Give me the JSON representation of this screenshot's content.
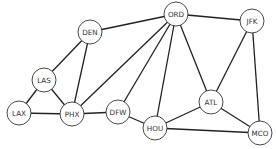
{
  "graph": {
    "node_radius": 12,
    "colors": {
      "edge": "#222222",
      "node_stroke": "#333333",
      "node_fill": "#ffffff",
      "label": "#333333"
    },
    "nodes": [
      {
        "id": "ORD",
        "label": "ORD",
        "x": 176,
        "y": 14
      },
      {
        "id": "JFK",
        "label": "JFK",
        "x": 252,
        "y": 21
      },
      {
        "id": "DEN",
        "label": "DEN",
        "x": 90,
        "y": 32
      },
      {
        "id": "LAS",
        "label": "LAS",
        "x": 44,
        "y": 80
      },
      {
        "id": "LAX",
        "label": "LAX",
        "x": 19,
        "y": 113
      },
      {
        "id": "PHX",
        "label": "PHX",
        "x": 72,
        "y": 114
      },
      {
        "id": "DFW",
        "label": "DFW",
        "x": 118,
        "y": 112
      },
      {
        "id": "HOU",
        "label": "HOU",
        "x": 155,
        "y": 128
      },
      {
        "id": "ATL",
        "label": "ATL",
        "x": 211,
        "y": 102
      },
      {
        "id": "MCO",
        "label": "MCO",
        "x": 260,
        "y": 133
      }
    ],
    "edges": [
      [
        "LAX",
        "LAS"
      ],
      [
        "LAX",
        "PHX"
      ],
      [
        "LAS",
        "PHX"
      ],
      [
        "LAS",
        "DEN"
      ],
      [
        "DEN",
        "PHX"
      ],
      [
        "DEN",
        "ORD"
      ],
      [
        "PHX",
        "ORD"
      ],
      [
        "PHX",
        "DFW"
      ],
      [
        "DFW",
        "ORD"
      ],
      [
        "DFW",
        "HOU"
      ],
      [
        "HOU",
        "ORD"
      ],
      [
        "ORD",
        "ATL"
      ],
      [
        "ORD",
        "JFK"
      ],
      [
        "JFK",
        "ATL"
      ],
      [
        "JFK",
        "MCO"
      ],
      [
        "ATL",
        "HOU"
      ],
      [
        "ATL",
        "MCO"
      ],
      [
        "HOU",
        "MCO"
      ]
    ]
  }
}
